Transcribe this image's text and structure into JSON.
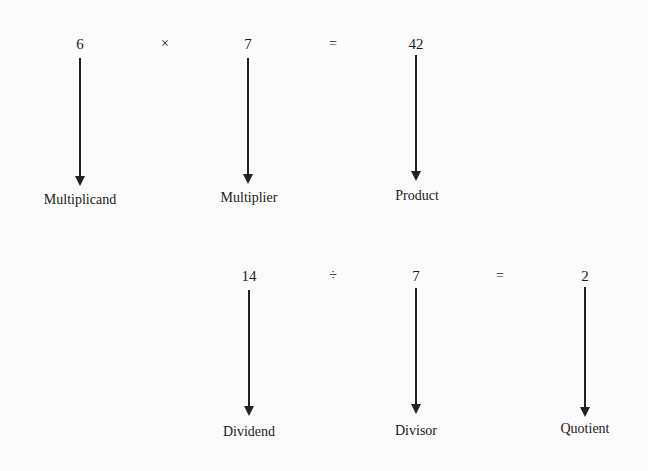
{
  "multiplication": {
    "multiplicand": "6",
    "operator": "×",
    "multiplier": "7",
    "equals": "=",
    "product": "42",
    "labels": {
      "multiplicand": "Multiplicand",
      "multiplier": "Multiplier",
      "product": "Product"
    }
  },
  "division": {
    "dividend": "14",
    "operator": "÷",
    "divisor": "7",
    "equals": "=",
    "quotient": "2",
    "labels": {
      "dividend": "Dividend",
      "divisor": "Divisor",
      "quotient": "Quotient"
    }
  }
}
